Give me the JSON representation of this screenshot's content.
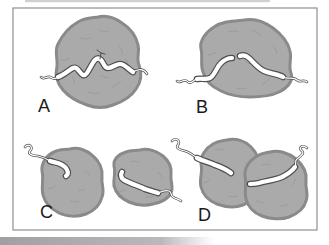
{
  "figure": {
    "panels": [
      {
        "label": "A"
      },
      {
        "label": "B"
      },
      {
        "label": "C"
      },
      {
        "label": "D"
      }
    ],
    "colors": {
      "background": "#ffffff",
      "frame": "#8f8f8f",
      "blob_fill": "#aaaaaa",
      "blob_outline": "#8a8a8a",
      "fiber_fill": "#ffffff",
      "fiber_outline": "#4f4f4f",
      "label_text": "#1a1a1a"
    }
  }
}
